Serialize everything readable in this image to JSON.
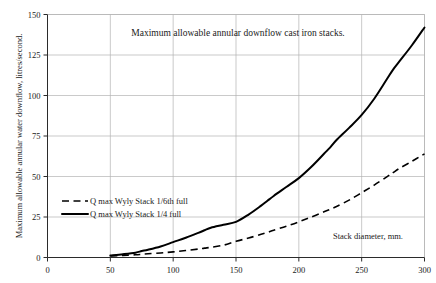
{
  "chart_data": {
    "type": "line",
    "title": "Maximum allowable annular downflow cast iron stacks.",
    "xlabel": "Stack diameter, mm.",
    "ylabel": "Maximum allowable annular water downflow, litres/second.",
    "xlim": [
      0,
      300
    ],
    "ylim": [
      0,
      150
    ],
    "xticks": [
      0,
      50,
      100,
      150,
      200,
      250,
      300
    ],
    "yticks": [
      0,
      25,
      50,
      75,
      100,
      125,
      150
    ],
    "grid": true,
    "legend_position": "inside-left",
    "x": [
      50,
      60,
      70,
      75,
      80,
      90,
      100,
      110,
      120,
      125,
      130,
      140,
      150,
      160,
      170,
      175,
      180,
      190,
      200,
      210,
      220,
      225,
      230,
      240,
      250,
      260,
      270,
      275,
      280,
      290,
      300
    ],
    "series": [
      {
        "name": "Q max Wyly Stack 1/6th full",
        "style": "dashed",
        "color": "#000000",
        "values": [
          1.0,
          1.3,
          1.7,
          2.0,
          2.3,
          2.8,
          3.5,
          4.3,
          5.2,
          5.8,
          6.3,
          7.6,
          10.0,
          12.0,
          14.3,
          15.5,
          16.8,
          19.3,
          22.0,
          25.0,
          28.2,
          29.8,
          31.5,
          35.4,
          40.0,
          44.7,
          49.8,
          52.4,
          55.0,
          59.4,
          64.0
        ]
      },
      {
        "name": "Q max Wyly Stack 1/4 full",
        "style": "solid",
        "color": "#000000",
        "values": [
          1.2,
          2.0,
          3.0,
          4.0,
          4.8,
          6.8,
          9.5,
          12.2,
          15.2,
          16.8,
          18.4,
          20.2,
          22.0,
          26.5,
          32.0,
          35.0,
          38.0,
          43.5,
          49.0,
          56.0,
          64.0,
          68.0,
          72.5,
          80.0,
          88.0,
          98.0,
          110.0,
          116.0,
          121.0,
          131.0,
          142.0
        ]
      }
    ]
  },
  "legend": {
    "items": [
      {
        "label": "Q max Wyly Stack 1/6th full",
        "style": "dashed"
      },
      {
        "label": "Q max Wyly Stack 1/4 full",
        "style": "solid"
      }
    ]
  }
}
